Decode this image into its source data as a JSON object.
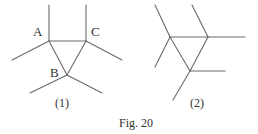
{
  "figure": {
    "caption": "Fig. 20",
    "line_color": "#6a6a6a",
    "text_color": "#333333"
  },
  "diagrams": [
    {
      "id": "1",
      "label": "(1)",
      "vertices": [
        {
          "name": "A",
          "label": "A",
          "x": 49,
          "y": 41
        },
        {
          "name": "C",
          "label": "C",
          "x": 86,
          "y": 41
        },
        {
          "name": "B",
          "label": "B",
          "x": 67,
          "y": 75
        }
      ],
      "triangle_edges": [
        [
          "A",
          "C"
        ],
        [
          "A",
          "B"
        ],
        [
          "C",
          "B"
        ]
      ],
      "branches": [
        {
          "from": "A",
          "to": [
            49,
            5
          ]
        },
        {
          "from": "A",
          "to": [
            12,
            60
          ]
        },
        {
          "from": "C",
          "to": [
            86,
            5
          ]
        },
        {
          "from": "C",
          "to": [
            122,
            60
          ]
        },
        {
          "from": "B",
          "to": [
            30,
            93
          ]
        },
        {
          "from": "B",
          "to": [
            102,
            93
          ]
        }
      ]
    },
    {
      "id": "2",
      "label": "(2)",
      "vertices": [
        {
          "name": "L",
          "label": "",
          "x": 170,
          "y": 37
        },
        {
          "name": "R",
          "label": "",
          "x": 208,
          "y": 37
        },
        {
          "name": "M",
          "label": "",
          "x": 190,
          "y": 71
        }
      ],
      "triangle_edges": [
        [
          "L",
          "R"
        ],
        [
          "L",
          "M"
        ],
        [
          "R",
          "M"
        ]
      ],
      "branches": [
        {
          "from": "L",
          "to": [
            155,
            5
          ]
        },
        {
          "from": "L",
          "to": [
            155,
            67
          ]
        },
        {
          "from": "R",
          "to": [
            192,
            5
          ]
        },
        {
          "from": "R",
          "to": [
            245,
            37
          ]
        },
        {
          "from": "M",
          "to": [
            225,
            71
          ]
        },
        {
          "from": "M",
          "to": [
            173,
            100
          ]
        }
      ]
    }
  ]
}
